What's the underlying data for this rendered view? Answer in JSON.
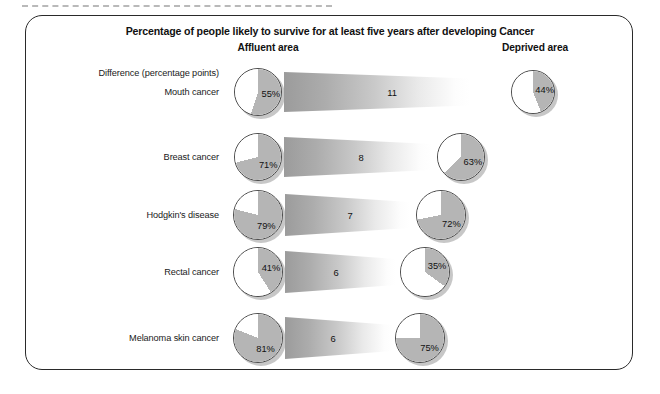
{
  "figure": {
    "title": "Percentage of people likely to survive for at least five years after developing Cancer",
    "difference_caption": "Difference (percentage points)",
    "column_headers": {
      "left": "Affluent area",
      "right": "Deprived area"
    },
    "colors": {
      "slice_gray": "#b5b5b5",
      "slice_empty": "#ffffff",
      "outline": "#4a4a4a",
      "band_gray": "#9a9a9a",
      "frame": "#2a2a2a",
      "text": "#1a1a1a"
    }
  },
  "chart_data": {
    "type": "pie",
    "title": "Percentage of people likely to survive for at least five years after developing Cancer",
    "xlabel": "",
    "ylabel": "",
    "legend_position": "top",
    "legend": [
      "Affluent area",
      "Deprived area"
    ],
    "categories": [
      "Mouth cancer",
      "Breast cancer",
      "Hodgkin's disease",
      "Rectal cancer",
      "Melanoma skin cancer"
    ],
    "series": [
      {
        "name": "Affluent area",
        "values": [
          55,
          71,
          79,
          41,
          81
        ]
      },
      {
        "name": "Deprived area",
        "values": [
          44,
          63,
          72,
          35,
          75
        ]
      },
      {
        "name": "Difference (percentage points)",
        "values": [
          11,
          8,
          7,
          6,
          6
        ]
      }
    ],
    "rows": [
      {
        "label": "Mouth cancer",
        "affluent_value": 55,
        "affluent_label": "55%",
        "deprived_value": 44,
        "deprived_label": "44%",
        "difference": 11,
        "difference_label": "11"
      },
      {
        "label": "Breast cancer",
        "affluent_value": 71,
        "affluent_label": "71%",
        "deprived_value": 63,
        "deprived_label": "63%",
        "difference": 8,
        "difference_label": "8"
      },
      {
        "label": "Hodgkin's disease",
        "affluent_value": 79,
        "affluent_label": "79%",
        "deprived_value": 72,
        "deprived_label": "72%",
        "difference": 7,
        "difference_label": "7"
      },
      {
        "label": "Rectal cancer",
        "affluent_value": 41,
        "affluent_label": "41%",
        "deprived_value": 35,
        "deprived_label": "35%",
        "difference": 6,
        "difference_label": "6"
      },
      {
        "label": "Melanoma skin cancer",
        "affluent_value": 81,
        "affluent_label": "81%",
        "deprived_value": 75,
        "deprived_label": "75%",
        "difference": 6,
        "difference_label": "6"
      }
    ]
  },
  "layout": {
    "rows_y": [
      92,
      157,
      215,
      272,
      338
    ],
    "affluent_cx": 258,
    "affluent_d": [
      48,
      48,
      50,
      50,
      50
    ],
    "deprived_cx": [
      533,
      461,
      441,
      425,
      420
    ],
    "deprived_d": [
      44,
      48,
      50,
      50,
      50
    ],
    "band_left": [
      284,
      284,
      285,
      285,
      285
    ],
    "band_right": [
      470,
      432,
      410,
      396,
      393
    ],
    "band_h_left": [
      40,
      40,
      42,
      42,
      42
    ],
    "band_h_right": [
      27,
      26,
      26,
      26,
      26
    ],
    "band_value_x": [
      392,
      361,
      350,
      336,
      333
    ]
  }
}
